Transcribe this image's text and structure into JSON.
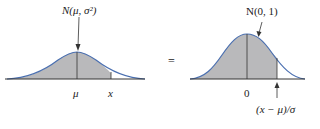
{
  "left_plot": {
    "title": "N(μ, σ²)",
    "tick_mean": "μ",
    "tick_x": "x"
  },
  "equals_sign": "=",
  "right_plot": {
    "title": "N(0, 1)",
    "tick_mean": "0",
    "tick_z": "(x − μ)/σ"
  },
  "colors": {
    "curve": "#4a6fb0",
    "fill": "#b9b9bb",
    "axis": "#333333"
  }
}
